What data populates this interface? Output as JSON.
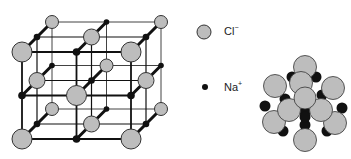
{
  "figure": {
    "lattice": {
      "size": 3,
      "origin": [
        22,
        52
      ],
      "spacing_x": 54.5,
      "spacing_y": 43.5,
      "depth_offset": [
        15,
        -15
      ]
    },
    "legend": [
      {
        "symbol": "Cl",
        "charge": "−",
        "kind": "large-grey-sphere"
      },
      {
        "symbol": "Na",
        "charge": "+",
        "kind": "small-black-dot"
      }
    ],
    "colors": {
      "cl_fill": "#bdbdbd",
      "cl_stroke": "#333333",
      "na_fill": "#111111",
      "line": "#111111"
    }
  }
}
